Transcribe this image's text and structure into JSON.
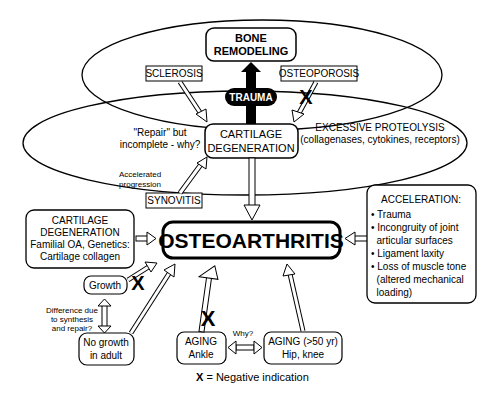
{
  "diagram": {
    "bone_remodeling": [
      "BONE",
      "REMODELING"
    ],
    "trauma": "TRAUMA",
    "sclerosis": "SCLEROSIS",
    "osteoporosis": "OSTEOPOROSIS",
    "repair_note": [
      "\"Repair\" but",
      "incomplete - why?"
    ],
    "cartilage_degeneration": [
      "CARTILAGE",
      "DEGENERATION"
    ],
    "excessive_proteolysis": [
      "EXCESSIVE PROTEOLYSIS",
      "(collagenases, cytokines, receptors)"
    ],
    "accelerated_note": [
      "Accelerated",
      "progression"
    ],
    "synovitis": "SYNOVITIS",
    "genetic_box": [
      "CARTILAGE",
      "DEGENERATION",
      "Familial OA, Genetics:",
      "Cartilage collagen"
    ],
    "osteoarthritis": "OSTEOARTHRITIS",
    "acceleration": {
      "title": "ACCELERATION:",
      "lines": [
        "• Trauma",
        "• Incongruity of joint",
        "  articular surfaces",
        "• Ligament laxity",
        "• Loss of muscle tone",
        "  (altered mechanical",
        "  loading)"
      ]
    },
    "growth": "Growth",
    "difference_note": [
      "Difference due",
      "to synthesis",
      "and repair?"
    ],
    "no_growth": [
      "No growth",
      "in adult"
    ],
    "aging_ankle": [
      "AGING",
      "Ankle"
    ],
    "why": "Why?",
    "aging_hip": [
      "AGING (>50 yr)",
      "Hip, knee"
    ],
    "negative_mark": "X",
    "legend": {
      "symbol": "X",
      "text": " = Negative indication"
    }
  }
}
